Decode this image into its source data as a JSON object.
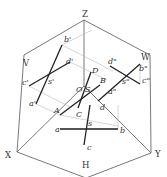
{
  "diagram": {
    "axes": {
      "z": "Z",
      "x": "X",
      "y": "Y"
    },
    "planes": {
      "v": "V",
      "w": "W",
      "h": "H"
    },
    "origin": "O",
    "points_3d": {
      "a": "A",
      "b": "B",
      "c": "C",
      "d": "D",
      "s": "S"
    },
    "v_projection": {
      "a": "a'",
      "b": "b'",
      "c": "c'",
      "d": "d'",
      "s": "s'"
    },
    "w_projection": {
      "a": "a\"",
      "b": "b\"",
      "c": "c\"",
      "d": "d\"",
      "s": "s\""
    },
    "h_projection": {
      "a": "a",
      "b": "b",
      "c": "c",
      "d": "d",
      "s": "s"
    }
  },
  "colors": {
    "frame": "#555555",
    "line": "#222222",
    "projector": "#bbbbbb"
  }
}
